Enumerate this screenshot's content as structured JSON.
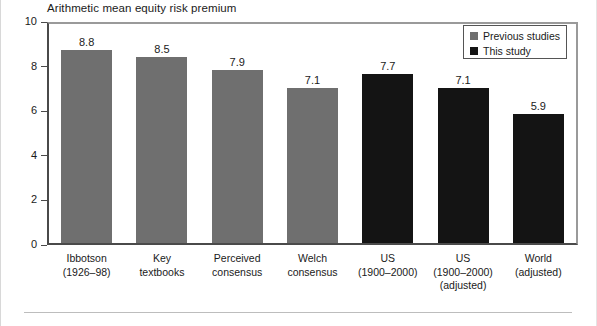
{
  "chart_data": {
    "type": "bar",
    "title": "Arithmetic mean equity risk premium",
    "xlabel": "",
    "ylabel": "",
    "ylim": [
      0,
      10
    ],
    "yticks": [
      0,
      2,
      4,
      6,
      8,
      10
    ],
    "grid": false,
    "legend_position": "top-right",
    "categories": [
      "Ibbotson (1926–98)",
      "Key textbooks",
      "Perceived consensus",
      "Welch consensus",
      "US (1900–2000)",
      "US (1900–2000) (adjusted)",
      "World (adjusted)"
    ],
    "category_lines": [
      [
        "Ibbotson",
        "(1926–98)"
      ],
      [
        "Key",
        "textbooks"
      ],
      [
        "Perceived",
        "consensus"
      ],
      [
        "Welch",
        "consensus"
      ],
      [
        "US",
        "(1900–2000)"
      ],
      [
        "US",
        "(1900–2000)",
        "(adjusted)"
      ],
      [
        "World",
        "(adjusted)"
      ]
    ],
    "values": [
      8.8,
      8.5,
      7.9,
      7.1,
      7.7,
      7.1,
      5.9
    ],
    "value_labels": [
      "8.8",
      "8.5",
      "7.9",
      "7.1",
      "7.7",
      "7.1",
      "5.9"
    ],
    "series_of_bar": [
      "prev",
      "prev",
      "prev",
      "prev",
      "this",
      "this",
      "this"
    ],
    "series": [
      {
        "name": "Previous studies",
        "key": "prev",
        "color": "#6f6f6f"
      },
      {
        "name": "This study",
        "key": "this",
        "color": "#141414"
      }
    ]
  },
  "legend": {
    "items": [
      {
        "label": "Previous studies",
        "key": "prev"
      },
      {
        "label": "This study",
        "key": "this"
      }
    ]
  },
  "axis": {
    "y_tick_labels": [
      "10",
      "8",
      "6",
      "4",
      "2",
      "0"
    ]
  }
}
